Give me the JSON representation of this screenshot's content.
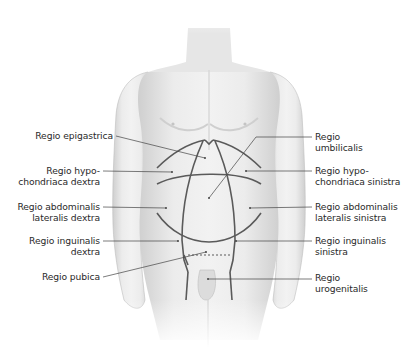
{
  "diagram": {
    "colors": {
      "skin_light": "#ededed",
      "skin_shade": "#c9c9c9",
      "region_line": "#5a5a5a",
      "leader_line": "#444444",
      "text": "#2a2a2a"
    },
    "labels_left": [
      {
        "id": "epigastrica",
        "text": "Regio epigastrica",
        "x": 113,
        "y": 128
      },
      {
        "id": "hypochondriaca-dextra",
        "text": "Regio hypo-\nchondriaca dextra",
        "x": 100,
        "y": 164
      },
      {
        "id": "abdominalis-lat-dextra",
        "text": "Regio abdominalis\nlateralis dextra",
        "x": 100,
        "y": 200
      },
      {
        "id": "inguinalis-dextra",
        "text": "Regio inguinalis\ndextra",
        "x": 100,
        "y": 236
      },
      {
        "id": "pubica",
        "text": "Regio pubica",
        "x": 100,
        "y": 270
      }
    ],
    "labels_right": [
      {
        "id": "umbilicalis",
        "text": "Regio\numbilicalis",
        "x": 315,
        "y": 130
      },
      {
        "id": "hypochondriaca-sinistra",
        "text": "Regio hypo-\nchondriaca sinistra",
        "x": 315,
        "y": 164
      },
      {
        "id": "abdominalis-lat-sinistra",
        "text": "Regio abdominalis\nlateralis sinistra",
        "x": 315,
        "y": 200
      },
      {
        "id": "inguinalis-sinistra",
        "text": "Regio inguinalis\nsinistra",
        "x": 315,
        "y": 236
      },
      {
        "id": "urogenitalis",
        "text": "Regio\nurogenitalis",
        "x": 315,
        "y": 271
      }
    ]
  }
}
